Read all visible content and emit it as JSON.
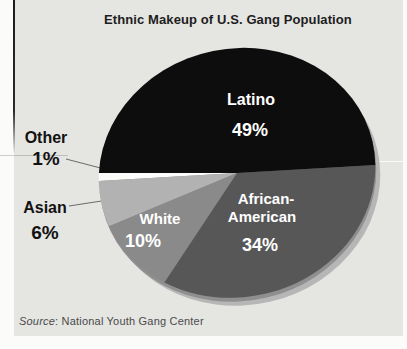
{
  "page": {
    "source_line": {
      "prefix": "Source",
      "rest": ": National Youth Gang Center"
    }
  },
  "colors": {
    "panel_bg": "#e5e5e2",
    "page_bg": "#fbfbfa",
    "title_color": "#1d1d1d",
    "rim_light": "#b6b6b6",
    "rim_mid": "#8f8f8f",
    "leader_line": "#4a4a4a",
    "inside_label": "#ffffff",
    "outside_label": "#121212"
  },
  "chart_data": {
    "type": "pie",
    "title": "Ethnic Makeup of U.S. Gang Population",
    "source": "National Youth Gang Center",
    "units": "percent",
    "total": 100,
    "legend_position": "none",
    "segments": [
      {
        "label": "Other",
        "value": 1,
        "pct_label": "1%",
        "color": "#fcfcfa",
        "label_placement": "outside"
      },
      {
        "label": "Asian",
        "value": 6,
        "pct_label": "6%",
        "color": "#b2b2b2",
        "label_placement": "outside"
      },
      {
        "label": "White",
        "value": 10,
        "pct_label": "10%",
        "color": "#8a8a8a",
        "label_placement": "inside"
      },
      {
        "label": "African-American",
        "value": 34,
        "pct_label": "34%",
        "color": "#575757",
        "label_placement": "inside",
        "label_lines": [
          "African-",
          "American"
        ]
      },
      {
        "label": "Latino",
        "value": 49,
        "pct_label": "49%",
        "color": "#0d0d0d",
        "label_placement": "inside"
      }
    ],
    "start_angle_deg": 194.5,
    "direction": "ccw",
    "projection": {
      "cx": 237,
      "cy": 173,
      "rx": 139,
      "ry": 124,
      "tilt_deg": -13
    }
  }
}
